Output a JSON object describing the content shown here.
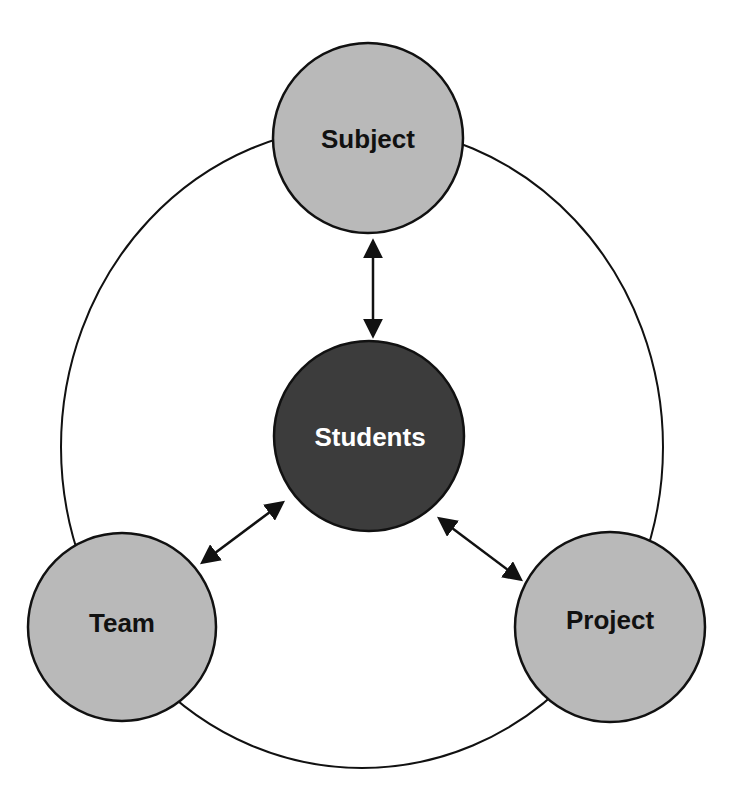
{
  "diagram": {
    "type": "relationship-cycle",
    "outer_ring": {
      "stroke": "#111111"
    },
    "center_node": {
      "id": "students",
      "label": "Students",
      "fill": "#3c3c3c",
      "text_color": "#ffffff"
    },
    "outer_nodes": [
      {
        "id": "subject",
        "label": "Subject",
        "fill": "#b9b9b9",
        "text_color": "#111111"
      },
      {
        "id": "team",
        "label": "Team",
        "fill": "#b9b9b9",
        "text_color": "#111111"
      },
      {
        "id": "project",
        "label": "Project",
        "fill": "#b9b9b9",
        "text_color": "#111111"
      }
    ],
    "edges": [
      {
        "from": "students",
        "to": "subject",
        "type": "bidirectional-arrow"
      },
      {
        "from": "students",
        "to": "team",
        "type": "bidirectional-arrow"
      },
      {
        "from": "students",
        "to": "project",
        "type": "bidirectional-arrow"
      }
    ]
  }
}
